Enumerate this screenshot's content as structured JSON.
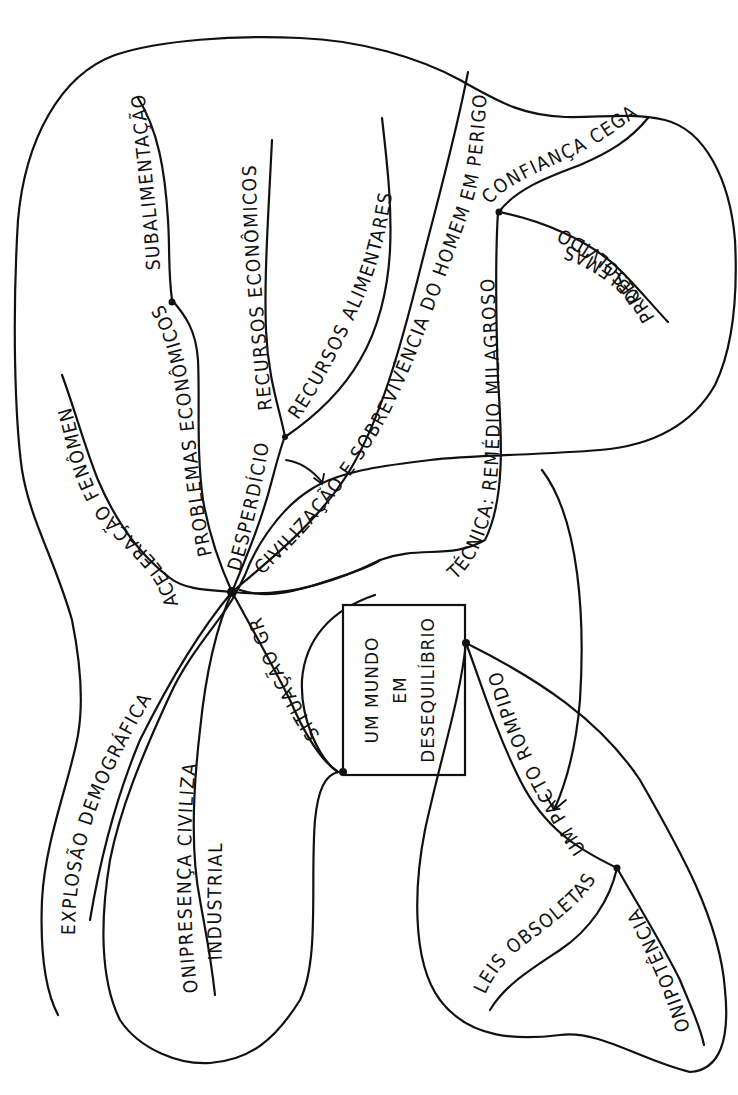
{
  "diagram": {
    "type": "mind-map",
    "ink_color": "#111111",
    "background": "#ffffff",
    "central_topic": {
      "lines": [
        "UM MUNDO",
        "EM",
        "DESEQUILÍBRIO"
      ]
    },
    "hub": {
      "branches": {
        "aceleracao": "ACELERAÇÃO FENÔMENOS",
        "problemas": "PROBLEMAS ECONÔMICOS",
        "subalimentacao": "SUBALIMENTAÇÃO",
        "desperdicio": "DESPERDÍCIO",
        "recursos_economicos": "RECURSOS ECONÔMICOS",
        "recursos_alimentares": "RECURSOS ALIMENTARES",
        "civilizacao": "CIVILIZAÇÃO E SOBREVIVÊNCIA DO HOMEM EM PERIGO",
        "explosao": "EXPLOSÃO DEMOGRÁFICA",
        "onipresenca": "ONIPRESENÇA CIVILIZAÇÃO",
        "onipresenca_2": "INDUSTRIAL",
        "situacao": "SITUAÇÃO GRAVE"
      }
    },
    "technique_cluster": {
      "tecnica": "TÉCNICA: REMÉDIO MILAGROSO",
      "confianca": "CONFIANÇA CEGA",
      "problemas_resolvidos_1": "PROBLEMAS",
      "problemas_resolvidos_2": "RESOLVIDOS"
    },
    "pact_cluster": {
      "pacto": "UM PACTO ROMPIDO",
      "leis": "LEIS OBSOLETAS",
      "onipotencia": "ONIPOTÊNCIA"
    }
  }
}
